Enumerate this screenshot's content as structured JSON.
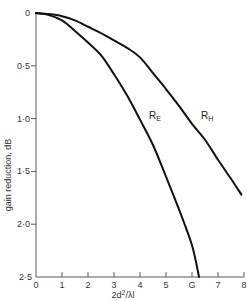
{
  "chart_data": {
    "type": "line",
    "title": "",
    "xlabel": "2d²/λl",
    "ylabel": "gain reduction, dB",
    "xlim": [
      0,
      8
    ],
    "ylim": [
      0,
      2.5
    ],
    "y_inverted": true,
    "grid": false,
    "legend": "inline labels on curves",
    "x_ticks": [
      0,
      1,
      2,
      3,
      4,
      5,
      6,
      7,
      8
    ],
    "x_tick_labels": [
      "0",
      "1",
      "2",
      "3",
      "4",
      "5",
      "G",
      "7",
      "8"
    ],
    "y_ticks": [
      0,
      0.5,
      1.0,
      1.5,
      2.0,
      2.5
    ],
    "y_tick_labels": [
      "0",
      "0·5",
      "1·0",
      "1·5",
      "2·0",
      "2·5"
    ],
    "series": [
      {
        "name": "R_E",
        "label_main": "R",
        "label_sub": "E",
        "label_pos": [
          4.35,
          1.0
        ],
        "x": [
          0,
          0.5,
          1.0,
          1.5,
          2.0,
          2.5,
          3.0,
          3.5,
          4.0,
          4.5,
          5.0,
          5.5,
          6.0,
          6.27
        ],
        "y": [
          0,
          0.02,
          0.07,
          0.17,
          0.28,
          0.4,
          0.58,
          0.78,
          1.01,
          1.25,
          1.55,
          1.86,
          2.2,
          2.5
        ]
      },
      {
        "name": "R_H",
        "label_main": "R",
        "label_sub": "H",
        "label_pos": [
          6.35,
          1.0
        ],
        "x": [
          0,
          0.5,
          1.0,
          1.5,
          2.0,
          2.5,
          3.0,
          3.5,
          4.0,
          4.5,
          5.0,
          5.5,
          6.0,
          6.5,
          7.0,
          7.5,
          7.9
        ],
        "y": [
          0,
          0.01,
          0.03,
          0.07,
          0.13,
          0.19,
          0.26,
          0.33,
          0.42,
          0.57,
          0.72,
          0.88,
          1.05,
          1.2,
          1.39,
          1.57,
          1.72
        ]
      }
    ]
  },
  "colors": {
    "curve": "#111111",
    "axis": "#5a5a5a",
    "text": "#333333",
    "background": "#ffffff"
  }
}
